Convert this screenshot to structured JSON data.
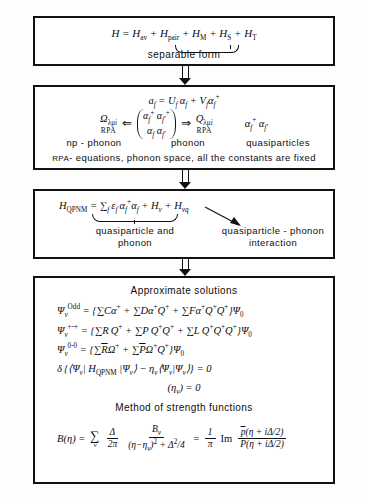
{
  "diagram": {
    "ink_color": "#111111",
    "background": "#fdfdfc"
  },
  "box1": {
    "equation": "H = Hₐᵥ + Hₚₐᵢᵣ + Hₘ + Hₛ + Hₜ",
    "eq_lhs": "H",
    "eq_terms": [
      "H",
      "av",
      "H",
      "pair",
      "H",
      "M",
      "H",
      "S",
      "H",
      "T"
    ],
    "brace_label": "separable form"
  },
  "box2": {
    "line1": "aƒ = Uƒ αƒ + Vƒ αƒ⁺",
    "omega_symbol": "Ω",
    "omega_sub": "λμᵢ",
    "omega_under": "RPA",
    "q_symbol": "Q",
    "q_sub": "λμᵢ",
    "q_under": "RPA",
    "bracket_top": "αƒ⁺ αƒ'⁺",
    "bracket_bottom": "αƒ αƒ'",
    "right_operators": "αƒ⁺ αƒ'",
    "label_left": "np - phonon",
    "label_mid": "phonon",
    "label_right": "quasiparticles",
    "footnote": "RPA - equations, phonon space, all the constants are fixed",
    "footnote_prefix": "RPA",
    "footnote_rest": "- equations, phonon space, all the constants are fixed"
  },
  "box3": {
    "equation": "HQPNM = Σƒ εƒ αƒ⁺ αƒ + Hᵥ + Hᵥq",
    "lhs": "H",
    "lhs_sub": "QPNM",
    "label_brace": "quasiparticle and phonon",
    "label_brace_line1": "quasiparticle and",
    "label_brace_line2": "phonon",
    "label_arrow": "quasiparticle - phonon interaction",
    "label_arrow_line1": "quasiparticle - phonon",
    "label_arrow_line2": "interaction"
  },
  "box4": {
    "title": "Approximate solutions",
    "eq_odd": "Ψᵥ^Odd = {ΣCα⁺ + ΣDα⁺Q⁺ + ΣFα⁺Q⁺Q⁺}Ψ₀",
    "eq_odd_sup": "Odd",
    "eq_even": "Ψᵥ^{+-+} = {ΣRQ⁺ + ΣPQ⁺Q⁺ + ΣLQ⁺Q⁺Q⁺}Ψ₀",
    "eq_even_sup": "+-+",
    "eq_zero": "Ψᵥ^{0-0} = {ΣR̄Ω⁺ + ΣP̄Ω⁺Q⁺}Ψ₀",
    "eq_zero_sup": "0-0",
    "variational": "δ{⟨Ψᵥ| HQPNM |Ψᵥ⟩ - ηᵥ⟨Ψᵥ|Ψᵥ⟩} = 0",
    "secular": "(ηᵥ) = 0",
    "method_title": "Method of strength functions",
    "strength_function": "B(η) = Σᵥ (Δ/2π) Bᵥ/[(η-ηᵥ)² + Δ²/4] = (1/π) Im [p̄(η+iΔ/2)/P̄(η+iΔ/2)]",
    "sf_lhs": "B(η)",
    "sf_delta_num": "Δ",
    "sf_delta_den": "2π",
    "sf_b_num": "Bᵥ",
    "sf_b_den": "(η-ηᵥ)² + Δ²/4",
    "sf_one": "1",
    "sf_pi": "π",
    "sf_im": "Im",
    "sf_frac_num": "p̄(η + iΔ/2)",
    "sf_frac_den": "P̄(η + iΔ/2)"
  },
  "arrows": {
    "a1": "double-arrow-down",
    "a2": "double-arrow-down",
    "a3": "double-arrow-down"
  }
}
